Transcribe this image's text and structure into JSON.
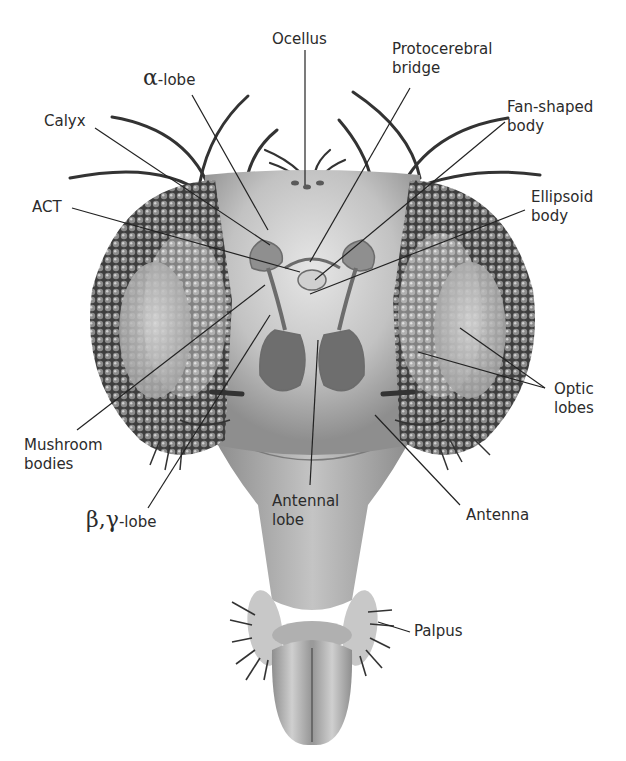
{
  "diagram": {
    "labels": {
      "ocellus": "Ocellus",
      "protocerebral_bridge_1": "Protocerebral",
      "protocerebral_bridge_2": "bridge",
      "alpha_lobe_greek": "α",
      "alpha_lobe_text": "-lobe",
      "calyx": "Calyx",
      "fan_shaped_body_1": "Fan-shaped",
      "fan_shaped_body_2": "body",
      "act": "ACT",
      "ellipsoid_body_1": "Ellipsoid",
      "ellipsoid_body_2": "body",
      "optic_lobes_1": "Optic",
      "optic_lobes_2": "lobes",
      "mushroom_bodies_1": "Mushroom",
      "mushroom_bodies_2": "bodies",
      "beta_gamma_greek": "β,γ",
      "beta_gamma_text": "-lobe",
      "antennal_lobe_1": "Antennal",
      "antennal_lobe_2": "lobe",
      "antenna": "Antenna",
      "palpus": "Palpus"
    },
    "colors": {
      "background": "#ffffff",
      "head": "#b8b8b8",
      "eye_dark": "#4a4a4a",
      "eye_light": "#9a9a9a",
      "leader_line": "#222222",
      "text": "#2b2b2b"
    }
  }
}
